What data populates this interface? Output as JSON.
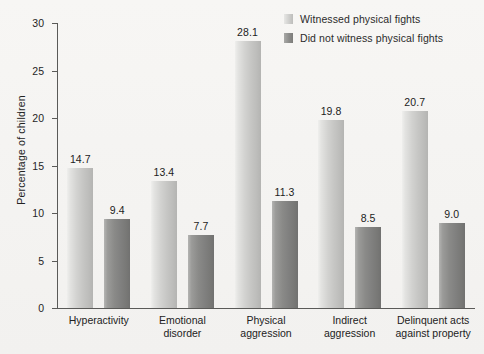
{
  "chart_data": {
    "type": "bar",
    "title": "",
    "xlabel": "",
    "ylabel": "Percentage of children",
    "ylim": [
      0,
      30
    ],
    "yticks": [
      0,
      5,
      10,
      15,
      20,
      25,
      30
    ],
    "ytick_labels": [
      "0",
      "5",
      "10",
      "15",
      "20",
      "25",
      "30"
    ],
    "grid": false,
    "legend_position": "top-right",
    "categories": [
      "Hyperactivity",
      "Emotional\ndisorder",
      "Physical\naggression",
      "Indirect\naggression",
      "Delinquent acts\nagainst property"
    ],
    "series": [
      {
        "name": "Witnessed physical fights",
        "color": "#cfcfcd",
        "values": [
          14.7,
          13.4,
          28.1,
          19.8,
          20.7
        ],
        "value_labels": [
          "14.7",
          "13.4",
          "28.1",
          "19.8",
          "20.7"
        ]
      },
      {
        "name": "Did not witness physical fights",
        "color": "#8a8a88",
        "values": [
          9.4,
          7.7,
          11.3,
          8.5,
          9.0
        ],
        "value_labels": [
          "9.4",
          "7.7",
          "11.3",
          "8.5",
          "9.0"
        ]
      }
    ]
  }
}
